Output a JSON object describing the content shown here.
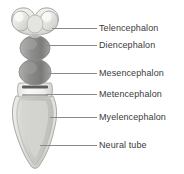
{
  "figure": {
    "background_color": "#ffffff",
    "label_color": "#3b3b3b",
    "leader_color": "#8a8a8a"
  },
  "labels": [
    {
      "id": "telencephalon",
      "text": "Telencephalon",
      "x": 99,
      "y": 23,
      "leader_x": 52,
      "leader_y": 28,
      "leader_width": 45
    },
    {
      "id": "diencephalon",
      "text": "Diencephalon",
      "x": 99,
      "y": 40,
      "leader_x": 44,
      "leader_y": 45,
      "leader_width": 53
    },
    {
      "id": "mesencephalon",
      "text": "Mesencephalon",
      "x": 99,
      "y": 68,
      "leader_x": 44,
      "leader_y": 73,
      "leader_width": 53
    },
    {
      "id": "metencephalon",
      "text": "Metencephalon",
      "x": 99,
      "y": 89,
      "leader_x": 46,
      "leader_y": 94,
      "leader_width": 51
    },
    {
      "id": "myelencephalon",
      "text": "Myelencephalon",
      "x": 99,
      "y": 112,
      "leader_x": 50,
      "leader_y": 117,
      "leader_width": 47
    },
    {
      "id": "neural-tube",
      "text": "Neural tube",
      "x": 99,
      "y": 140,
      "leader_x": 40,
      "leader_y": 145,
      "leader_width": 57
    }
  ],
  "illustration": {
    "regions": [
      {
        "id": "telencephalon-vesicles",
        "name": "Telencephalon vesicles",
        "fill": "#e8e8e6"
      },
      {
        "id": "diencephalon-vesicle",
        "name": "Diencephalon vesicle",
        "fill": "#8f8f8d"
      },
      {
        "id": "mesencephalon-vesicle",
        "name": "Mesencephalon vesicle",
        "fill": "#8a8a88"
      },
      {
        "id": "metencephalon-vesicle",
        "name": "Metencephalon vesicle",
        "fill": "#eeeeec"
      },
      {
        "id": "myelencephalon-body",
        "name": "Myelencephalon body",
        "fill": "#d9d9d6"
      },
      {
        "id": "neural-tube-shaft",
        "name": "Neural tube shaft",
        "fill": "#cfcfcc"
      }
    ],
    "outline_color": "#9a9a98"
  }
}
